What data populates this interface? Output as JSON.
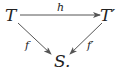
{
  "diagram": {
    "nodes": {
      "T": "T",
      "T_prime": "T′",
      "S": "S."
    },
    "arrows": {
      "h": "h",
      "f": "f",
      "f_prime": "f′"
    },
    "colors": {
      "ink": "#222222",
      "arrow": "#555555"
    }
  }
}
